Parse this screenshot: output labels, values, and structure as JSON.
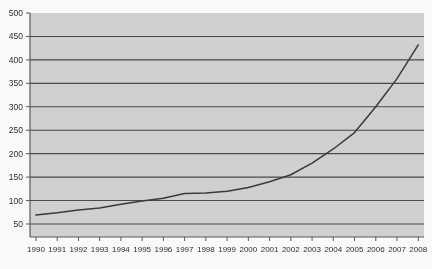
{
  "chart_data": {
    "type": "line",
    "title": "",
    "subtitle": "",
    "xlabel": "",
    "ylabel": "",
    "x": [
      1990,
      1991,
      1992,
      1993,
      1994,
      1995,
      1996,
      1997,
      1998,
      1999,
      2000,
      2001,
      2002,
      2003,
      2004,
      2005,
      2006,
      2007,
      2008
    ],
    "categories": [
      "1990",
      "1991",
      "1992",
      "1993",
      "1994",
      "1995",
      "1996",
      "1997",
      "1998",
      "1999",
      "2000",
      "2001",
      "2002",
      "2003",
      "2004",
      "2005",
      "2006",
      "2007",
      "2008"
    ],
    "values": [
      69,
      74,
      80,
      84,
      92,
      99,
      105,
      115,
      116,
      120,
      128,
      140,
      155,
      180,
      210,
      245,
      300,
      360,
      432
    ],
    "series": [
      {
        "name": "series-1",
        "color": "#3a3a3a",
        "values": [
          69,
          74,
          80,
          84,
          92,
          99,
          105,
          115,
          116,
          120,
          128,
          140,
          155,
          180,
          210,
          245,
          300,
          360,
          432
        ]
      }
    ],
    "ylim": [
      0,
      500
    ],
    "xlim": [
      1990,
      2008
    ],
    "ytick_values": [
      50,
      100,
      150,
      200,
      250,
      300,
      350,
      400,
      450,
      500
    ],
    "ytick_labels": [
      "50",
      "100",
      "150",
      "200",
      "250",
      "300",
      "350",
      "400",
      "450",
      "500"
    ],
    "xtick_labels": [
      "1990",
      "1991",
      "1992",
      "1993",
      "1994",
      "1995",
      "1996",
      "1997",
      "1998",
      "1999",
      "2000",
      "2001",
      "2002",
      "2003",
      "2004",
      "2005",
      "2006",
      "2007",
      "2008"
    ],
    "grid": true,
    "grid_axis": "y",
    "legend": false,
    "legend_position": "none",
    "plot_background_color": "#d2d2d2",
    "gridline_color": "#4a4a4a",
    "axis_color": "#5a5a5a",
    "page_background_color": "#fcfcfc",
    "annotations": []
  },
  "figure": {
    "width": 432,
    "height": 269
  }
}
